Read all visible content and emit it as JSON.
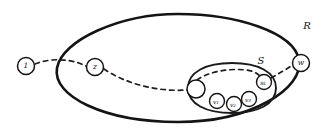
{
  "figure": {
    "background_color": "#ffffff",
    "ink_color": "#141414"
  },
  "regions": [
    {
      "id": "outer",
      "label": "R",
      "label_x": 307,
      "label_y": 26,
      "cx": 178,
      "cy": 68,
      "rx": 122,
      "ry": 54,
      "rotation": -2
    },
    {
      "id": "inner",
      "label": "S",
      "label_x": 261,
      "label_y": 61,
      "cx": 232,
      "cy": 88,
      "rx": 44,
      "ry": 25,
      "rotation": -3
    }
  ],
  "nodes": [
    {
      "id": "n-one",
      "label": "1",
      "sub": "",
      "cx": 26,
      "cy": 66,
      "r": 8.5,
      "size": "main",
      "inside": "none"
    },
    {
      "id": "n-z",
      "label": "z",
      "sub": "",
      "cx": 95,
      "cy": 67,
      "r": 8.5,
      "size": "main",
      "inside": "outer"
    },
    {
      "id": "n-w",
      "label": "w",
      "sub": "",
      "cx": 301,
      "cy": 63,
      "r": 8.5,
      "size": "main",
      "inside": "outer"
    },
    {
      "id": "n-empty",
      "label": "",
      "sub": "",
      "cx": 196,
      "cy": 89,
      "r": 9,
      "size": "main",
      "inside": "inner"
    },
    {
      "id": "n-v1",
      "label": "v",
      "sub": "1",
      "cx": 217,
      "cy": 101,
      "r": 7.5,
      "size": "tiny",
      "inside": "inner"
    },
    {
      "id": "n-v2",
      "label": "v",
      "sub": "2",
      "cx": 234,
      "cy": 104,
      "r": 7.5,
      "size": "tiny",
      "inside": "inner"
    },
    {
      "id": "n-v3",
      "label": "v",
      "sub": "3",
      "cx": 249,
      "cy": 99,
      "r": 7.5,
      "size": "tiny",
      "inside": "inner"
    },
    {
      "id": "n-s",
      "label": "s",
      "sub": "k",
      "cx": 264,
      "cy": 82,
      "r": 7.5,
      "size": "tiny",
      "inside": "inner"
    }
  ],
  "paths": [
    {
      "id": "path-1-to-z",
      "from": "n-one",
      "to": "n-z",
      "style": "dashed",
      "d": "M 35 64 C 50 58, 66 59, 79 63 L 86 66"
    },
    {
      "id": "path-z-to-empty",
      "from": "n-z",
      "to": "n-empty",
      "style": "dashed",
      "d": "M 104 69 C 126 84, 158 92, 187 90"
    },
    {
      "id": "path-empty-arc-to-s",
      "from": "n-empty",
      "to": "n-s",
      "style": "dashed",
      "d": "M 197 80 C 208 72, 228 68, 246 70 C 255 71, 260 75, 262 79"
    },
    {
      "id": "path-s-to-w",
      "from": "n-s",
      "to": "n-w",
      "style": "dashed",
      "d": "M 271 78 C 280 73, 288 68, 293 65"
    }
  ]
}
